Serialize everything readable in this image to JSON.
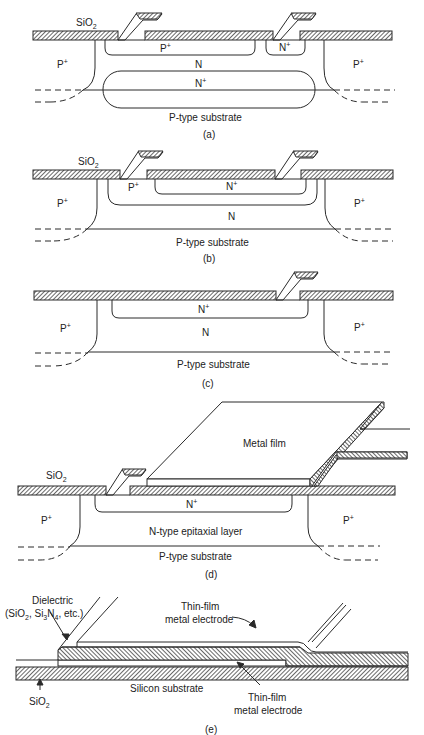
{
  "figure": {
    "colors": {
      "line": "#2a2a2a",
      "hatch": "#2a2a2a",
      "background": "#ffffff"
    },
    "panels": {
      "a": {
        "caption": "(a)",
        "oxide_label": "SiO",
        "oxide_sub": "2",
        "left_isolation": "P",
        "right_isolation": "P",
        "plus": "+",
        "p_region": "P",
        "n_contact": "N",
        "n_region": "N",
        "buried_layer": "N",
        "substrate": "P-type substrate"
      },
      "b": {
        "caption": "(b)",
        "oxide_label": "SiO",
        "oxide_sub": "2",
        "left_isolation": "P",
        "right_isolation": "P",
        "plus": "+",
        "p_region": "P",
        "n_plus_region": "N",
        "n_region": "N",
        "substrate": "P-type substrate"
      },
      "c": {
        "caption": "(c)",
        "left_isolation": "P",
        "right_isolation": "P",
        "plus": "+",
        "n_plus_region": "N",
        "n_region": "N",
        "substrate": "P-type substrate"
      },
      "d": {
        "caption": "(d)",
        "oxide_label": "SiO",
        "oxide_sub": "2",
        "metal": "Metal film",
        "left_isolation": "P",
        "right_isolation": "P",
        "plus": "+",
        "n_plus_region": "N",
        "epi_layer": "N-type epitaxial layer",
        "substrate": "P-type substrate"
      },
      "e": {
        "caption": "(e)",
        "dielectric_line1": "Dielectric",
        "dielectric_line2_a": "(SiO",
        "dielectric_line2_sub1": "2",
        "dielectric_line2_b": ", Si",
        "dielectric_line2_sub2": "3",
        "dielectric_line2_c": "N",
        "dielectric_line2_sub3": "4",
        "dielectric_line2_d": ", etc.)",
        "top_electrode_line1": "Thin-film",
        "top_electrode_line2": "metal electrode",
        "substrate": "Silicon substrate",
        "oxide_label": "SiO",
        "oxide_sub": "2",
        "bottom_electrode_line1": "Thin-film",
        "bottom_electrode_line2": "metal electrode"
      }
    }
  }
}
